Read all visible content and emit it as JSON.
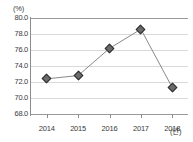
{
  "artifacts": {
    "top_strip_text": "’ ’ ’ ’ ’ ’ ’ ’ ’ ’ ’ ’"
  },
  "axis": {
    "y_unit_label": "(%)",
    "x_unit_label": "(년)",
    "y_ticks": [
      "80.0",
      "78.0",
      "76.0",
      "74.0",
      "72.0",
      "70.0",
      "68.0"
    ],
    "x_ticks": [
      "2014",
      "2015",
      "2016",
      "2017",
      "2018"
    ]
  },
  "colors": {
    "line": "#8a8a8a",
    "marker_fill": "#6b6b6b",
    "marker_edge": "#2f2f2f",
    "grid": "#d9d9d9",
    "axis": "#8c8c8c",
    "text": "#3a3a3a",
    "background": "#ffffff"
  },
  "chart_data": {
    "type": "line",
    "title": "",
    "xlabel": "(년)",
    "ylabel": "(%)",
    "categories": [
      "2014",
      "2015",
      "2016",
      "2017",
      "2018"
    ],
    "values": [
      72.4,
      72.8,
      76.2,
      78.6,
      71.3
    ],
    "series": [
      {
        "name": "",
        "values": [
          72.4,
          72.8,
          76.2,
          78.6,
          71.3
        ]
      }
    ],
    "ylim": [
      68.0,
      80.0
    ],
    "ytick_values": [
      80.0,
      78.0,
      76.0,
      74.0,
      72.0,
      70.0,
      68.0
    ],
    "ytick_labels": [
      "80.0",
      "78.0",
      "76.0",
      "74.0",
      "72.0",
      "70.0",
      "68.0"
    ],
    "grid": true,
    "grid_axis": "y",
    "legend": false,
    "marker": "diamond"
  }
}
